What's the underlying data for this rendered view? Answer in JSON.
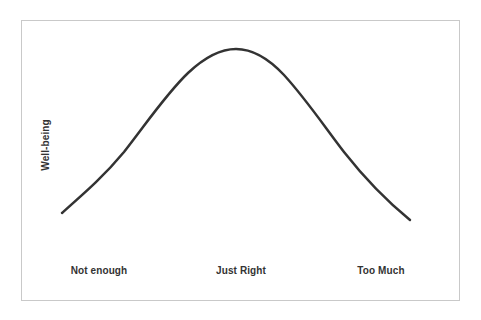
{
  "figure": {
    "width": 481,
    "height": 320,
    "background_color": "#ffffff",
    "border_color": "#c9c9c9",
    "alt_title": "Well-being Curve"
  },
  "chart_data": {
    "type": "line",
    "title": "",
    "subtitle": "",
    "xlabel": "",
    "ylabel": "Well-being",
    "x_tick_labels": [
      "Not enough",
      "Just Right",
      "Too Much"
    ],
    "y_tick_labels": [],
    "grid": false,
    "legend": [],
    "legend_position": "none",
    "axes_visible": false,
    "xlim": [
      0,
      2
    ],
    "ylim": [
      0,
      1
    ],
    "series": [
      {
        "name": "Well-being",
        "color": "#333333",
        "line_width": 2.5,
        "x": [
          0.0,
          0.1,
          0.2,
          0.3,
          0.4,
          0.5,
          0.6,
          0.7,
          0.8,
          0.9,
          1.0,
          1.1,
          1.2,
          1.3,
          1.4,
          1.5,
          1.6,
          1.7,
          1.8,
          1.9,
          2.0
        ],
        "y": [
          0.0,
          0.06,
          0.14,
          0.24,
          0.37,
          0.52,
          0.67,
          0.81,
          0.92,
          0.98,
          1.0,
          0.98,
          0.92,
          0.83,
          0.71,
          0.58,
          0.45,
          0.33,
          0.21,
          0.1,
          0.0
        ]
      }
    ],
    "annotations": [
      {
        "label": "Not enough",
        "x": 0.0
      },
      {
        "label": "Just Right",
        "x": 1.0
      },
      {
        "label": "Too Much",
        "x": 2.0
      }
    ]
  },
  "curve_path": "M 62 213 C 88 190 104 176 124 152 C 146 124 166 94 188 73 C 206 56 222 49 236 49 C 252 49 268 58 284 75 C 306 99 324 126 344 152 C 366 180 388 202 410 220",
  "curve_color": "#333333",
  "curve_width": 2.5
}
